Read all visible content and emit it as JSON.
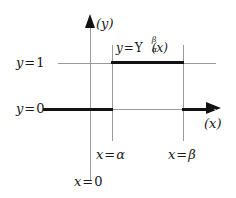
{
  "figure": {
    "axes": {
      "y_axis_label": "(y)",
      "x_axis_label": "(x)",
      "y_axis_icon": "up-arrow-icon",
      "x_axis_icon": "right-arrow-icon"
    },
    "labels": {
      "y_one": {
        "var": "y",
        "op": "=",
        "value": "1"
      },
      "y_zero": {
        "var": "y",
        "op": "=",
        "value": "0"
      },
      "x_alpha": {
        "var": "x",
        "op": "=",
        "value": "α"
      },
      "x_beta": {
        "var": "x",
        "op": "=",
        "value": "β"
      },
      "x_zero": {
        "var": "x",
        "op": "=",
        "value": "0"
      }
    },
    "function_label": {
      "lhs": "y",
      "op": "=",
      "symbol": "Υ",
      "subscript": "α",
      "superscript": "β",
      "argument": "(x)"
    },
    "colors": {
      "ink": "#121212",
      "thin_line": "#9a9a9a",
      "background": "#ffffff"
    }
  },
  "chart_data": {
    "type": "line",
    "xlabel": "(x)",
    "ylabel": "(y)",
    "grid": false,
    "legend": "none",
    "xlim": [
      -1,
      3
    ],
    "ylim": [
      -0.4,
      1.6
    ],
    "x_ticks": [
      {
        "label": "x = 0",
        "value": 0
      },
      {
        "label": "x = α",
        "value": 1
      },
      {
        "label": "x = β",
        "value": 2.2
      }
    ],
    "y_ticks": [
      {
        "label": "y = 0",
        "value": 0
      },
      {
        "label": "y = 1",
        "value": 1
      }
    ],
    "series": [
      {
        "name": "Υ_α^β(x)",
        "style": "bold-step",
        "points": [
          {
            "x": -0.8,
            "y": 0
          },
          {
            "x": 1.0,
            "y": 0
          },
          {
            "x": 1.0,
            "y": 1
          },
          {
            "x": 2.2,
            "y": 1
          },
          {
            "x": 2.2,
            "y": 0
          },
          {
            "x": 2.8,
            "y": 0
          }
        ]
      }
    ],
    "reference_lines": [
      {
        "orientation": "horizontal",
        "value": 1,
        "label": "y = 1",
        "style": "thin"
      },
      {
        "orientation": "horizontal",
        "value": 0,
        "label": "y = 0",
        "style": "thin"
      },
      {
        "orientation": "vertical",
        "value": 1,
        "label": "x = α",
        "style": "thin"
      },
      {
        "orientation": "vertical",
        "value": 2.2,
        "label": "x = β",
        "style": "thin"
      },
      {
        "orientation": "vertical",
        "value": 0,
        "label": "x = 0",
        "style": "thin"
      }
    ]
  }
}
